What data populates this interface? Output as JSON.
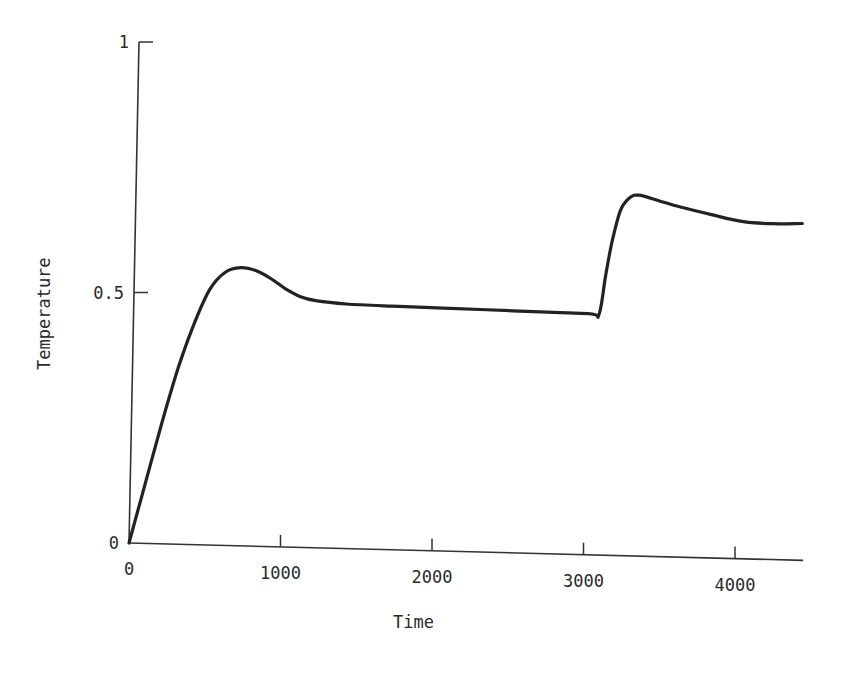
{
  "figure": {
    "caption": "Figure"
  },
  "chart_data": {
    "type": "line",
    "title": "",
    "xlabel": "Time",
    "ylabel": "Temperature",
    "xlim": [
      0,
      4450
    ],
    "ylim": [
      0,
      1
    ],
    "x_ticks": [
      0,
      1000,
      2000,
      3000,
      4000
    ],
    "x_tick_labels": [
      "0",
      "1000",
      "2000",
      "3000",
      "4000"
    ],
    "y_ticks": [
      0,
      0.5,
      1
    ],
    "y_tick_labels": [
      "0",
      "0.5",
      "1"
    ],
    "grid": false,
    "legend": null,
    "series": [
      {
        "name": "Temperature",
        "color": "#222222",
        "x": [
          0,
          100,
          200,
          300,
          400,
          500,
          600,
          700,
          800,
          900,
          1000,
          1100,
          1200,
          1400,
          1700,
          2000,
          2500,
          3000,
          3070,
          3110,
          3150,
          3200,
          3260,
          3320,
          3450,
          3600,
          3800,
          4000,
          4200,
          4400
        ],
        "y": [
          0,
          0.12,
          0.24,
          0.35,
          0.44,
          0.51,
          0.545,
          0.555,
          0.55,
          0.535,
          0.515,
          0.5,
          0.493,
          0.488,
          0.486,
          0.485,
          0.483,
          0.481,
          0.48,
          0.56,
          0.63,
          0.69,
          0.715,
          0.72,
          0.71,
          0.698,
          0.685,
          0.673,
          0.67,
          0.672
        ]
      }
    ]
  }
}
